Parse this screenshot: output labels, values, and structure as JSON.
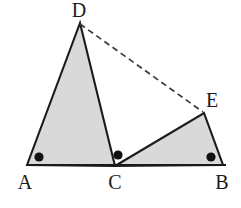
{
  "figure": {
    "type": "geometry-diagram",
    "canvas": {
      "width": 241,
      "height": 208
    },
    "background_color": "#ffffff",
    "stroke_color": "#1a1a1a",
    "fill_color": "#d9d9d9",
    "dash_color": "#3a3a3a",
    "dot_color": "#111111"
  },
  "points": {
    "A": {
      "label": "A",
      "x": 27,
      "y": 165,
      "label_x": 25,
      "label_y": 182
    },
    "B": {
      "label": "B",
      "x": 223,
      "y": 165,
      "label_x": 222,
      "label_y": 182
    },
    "C": {
      "label": "C",
      "x": 115,
      "y": 166,
      "label_x": 115,
      "label_y": 182
    },
    "D": {
      "label": "D",
      "x": 80,
      "y": 23,
      "label_x": 79,
      "label_y": 10
    },
    "E": {
      "label": "E",
      "x": 204,
      "y": 113,
      "label_x": 212,
      "label_y": 100
    }
  },
  "shapes": {
    "triangle_adc": {
      "name": "triangle-ADC",
      "vertices": "27,165 80,23 115,166",
      "filled": true
    },
    "triangle_ceb": {
      "name": "triangle-CEB",
      "vertices": "115,166 204,113 223,165",
      "filled": true
    },
    "baseline": {
      "name": "segment-AB",
      "x1": 27,
      "y1": 165,
      "x2": 226,
      "y2": 165
    },
    "dashed_segment": {
      "name": "segment-DE",
      "x1": 80,
      "y1": 24,
      "x2": 203,
      "y2": 112,
      "dash_pattern": "6,4"
    }
  },
  "angle_markers": [
    {
      "name": "angle-dot-at-A",
      "x": 39,
      "y": 157,
      "r": 4.6
    },
    {
      "name": "angle-dot-at-C",
      "x": 118,
      "y": 155,
      "r": 4.6
    },
    {
      "name": "angle-dot-at-B",
      "x": 211,
      "y": 157,
      "r": 4.6
    }
  ]
}
